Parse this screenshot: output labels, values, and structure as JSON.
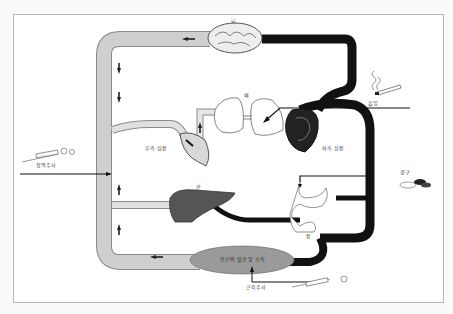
{
  "diagram": {
    "type": "drug-circulation-pathway",
    "labels": {
      "brain": "뇌",
      "lungs": "폐",
      "inhalation": "흡입",
      "left_heart": "좌측 심장",
      "right_heart": "우측 심장",
      "liver": "간",
      "stomach": "위",
      "intestine": "장",
      "oral": "경구",
      "iv_injection": "정맥주사",
      "im_injection": "근육주사",
      "tissue": "전신의 혈관 및 조직"
    },
    "colors": {
      "venous": "#c8c8c8",
      "arterial": "#111111",
      "liver": "#555555",
      "tissue": "#9a9a9a",
      "frame": "#b8b8b8"
    }
  }
}
